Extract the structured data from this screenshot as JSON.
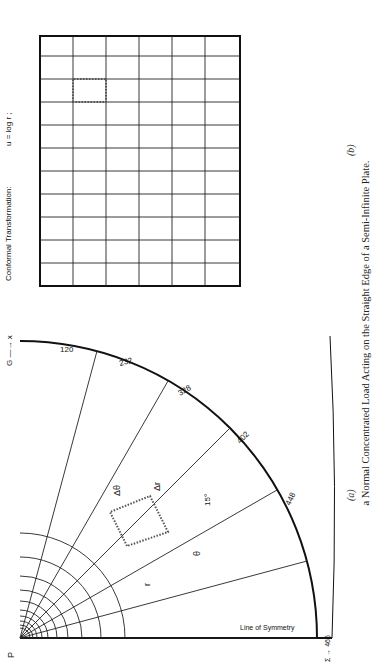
{
  "caption": "a Normal Concentrated Load Acting on the Straight Edge of a Semi-Infinite Plate.",
  "panel_a": {
    "label": "(a)",
    "load_label": "P",
    "origin_label": "C",
    "point_A": "A",
    "x_axis": "G —→ x",
    "y_axis": "y",
    "section_label": "Section — A",
    "sigma_label": "Σ → 465",
    "symmetry_label": "Line of Symmetry",
    "top_index": [
      "1",
      "2",
      "3",
      "4",
      "5",
      "6",
      "7",
      "8",
      "9",
      "10",
      "11"
    ],
    "r_labels": [
      "(r = 1.00\")",
      "(r = 1.30\")",
      "(r = 1.69\")",
      "(r = 2.19\")",
      "(r = 2.85\")",
      "(r = 3.70\")",
      "(r = 4.81\")",
      "(r = 6.25\")",
      "(r = 8.12\")",
      "(r = 10.5\")",
      "(r = 13.7\")"
    ],
    "arc_values": [
      {
        "value": "120",
        "label": "F"
      },
      {
        "value": "232",
        "label": "E"
      },
      {
        "value": "328",
        "label": "D"
      },
      {
        "value": "402",
        "label": "C"
      },
      {
        "value": "448",
        "label": "B"
      }
    ],
    "delta_theta": "Δθ",
    "delta_r": "Δr",
    "theta": "θ",
    "r": "r",
    "angle": "15°"
  },
  "panel_b": {
    "label": "(b)",
    "title": "Conformal Transformation:",
    "eq1": "u = log r ;",
    "eq2": "v = θ .",
    "u_axis": "u",
    "v_axis": "v",
    "section_label": "Section — 1",
    "col_index": [
      "1",
      "2",
      "3",
      "4",
      "5",
      "6",
      "7",
      "8",
      "9",
      "10",
      "11"
    ],
    "rows": [
      {
        "label": "G",
        "value": ""
      },
      {
        "label": "F",
        "value": "1650"
      },
      {
        "label": "E",
        "value": "3185"
      },
      {
        "label": "D",
        "value": "4500"
      },
      {
        "label": "C",
        "value": "5520"
      },
      {
        "label": "B",
        "value": "6150"
      },
      {
        "label": "A",
        "value": "6375"
      }
    ],
    "top_values": [
      "120",
      "232",
      "328",
      "402",
      "448",
      "465"
    ],
    "delta_u": "Δu",
    "delta_v": "Δv",
    "centerline": "℄"
  }
}
